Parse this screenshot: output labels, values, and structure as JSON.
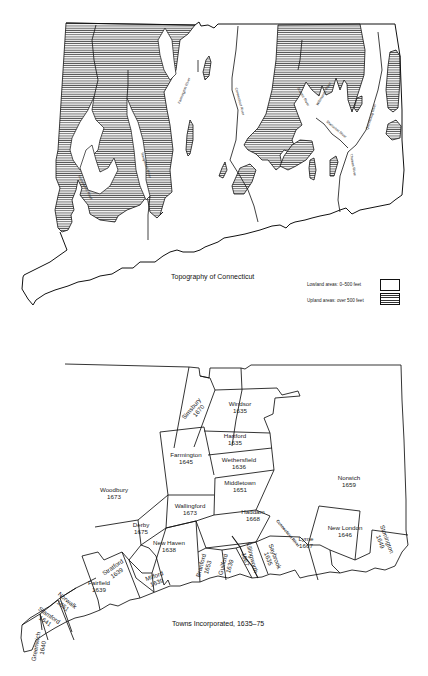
{
  "maps": [
    {
      "title": "Topography of Connecticut",
      "legend": [
        {
          "label": "Lowland areas: 0–500 feet",
          "pattern": "blank"
        },
        {
          "label": "Upland areas: over 500 feet",
          "pattern": "horizontal-hatch"
        }
      ],
      "rivers": [
        "Housatonic River",
        "Naugatuck River",
        "Farmington River",
        "Connecticut River",
        "Scantic River",
        "Willimantic River",
        "Shetucket River",
        "Quinebaug River",
        "Thames River"
      ]
    },
    {
      "title": "Towns Incorporated, 1635–75",
      "towns": [
        {
          "name": "Simsbury",
          "year": "1670"
        },
        {
          "name": "Windsor",
          "year": "1635"
        },
        {
          "name": "Hartford",
          "year": "1635"
        },
        {
          "name": "Farmington",
          "year": "1645"
        },
        {
          "name": "Wethersfield",
          "year": "1636"
        },
        {
          "name": "Middletown",
          "year": "1651"
        },
        {
          "name": "Woodbury",
          "year": "1673"
        },
        {
          "name": "Wallingford",
          "year": "1673"
        },
        {
          "name": "Derby",
          "year": "1675"
        },
        {
          "name": "Haddam",
          "year": "1668"
        },
        {
          "name": "Norwich",
          "year": "1659"
        },
        {
          "name": "New Haven",
          "year": "1638"
        },
        {
          "name": "Stratford",
          "year": "1639"
        },
        {
          "name": "Milford",
          "year": "1639"
        },
        {
          "name": "Branford",
          "year": "1653"
        },
        {
          "name": "Guilford",
          "year": "1639"
        },
        {
          "name": "Killingworth",
          "year": "1667"
        },
        {
          "name": "Saybrook",
          "year": "1635"
        },
        {
          "name": "Lyme",
          "year": "1667"
        },
        {
          "name": "New London",
          "year": "1646"
        },
        {
          "name": "Stonington",
          "year": "1649"
        },
        {
          "name": "Fairfield",
          "year": "1639"
        },
        {
          "name": "Norwalk",
          "year": "1651"
        },
        {
          "name": "Stamford",
          "year": "1641"
        },
        {
          "name": "Greenwich",
          "year": "1640"
        }
      ],
      "river_label": "Connecticut River"
    }
  ]
}
